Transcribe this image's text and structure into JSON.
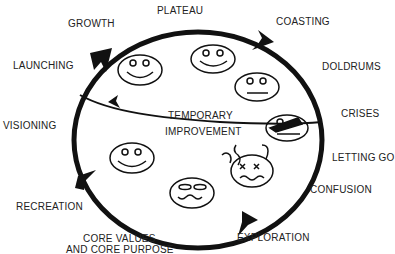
{
  "diagram": {
    "title": "",
    "colors": {
      "line": "#111111",
      "text": "#222222",
      "background": "#ffffff"
    },
    "stages": [
      {
        "id": "plateau",
        "label": "PLATEAU"
      },
      {
        "id": "coasting",
        "label": "COASTING"
      },
      {
        "id": "doldrums",
        "label": "DOLDRUMS"
      },
      {
        "id": "crises",
        "label": "CRISES"
      },
      {
        "id": "letting-go",
        "label": "LETTING GO"
      },
      {
        "id": "confusion",
        "label": "CONFUSION"
      },
      {
        "id": "exploration",
        "label": "EXPLORATION"
      },
      {
        "id": "core-values",
        "label_line1": "CORE VALUES",
        "label_line2": "AND CORE PURPOSE"
      },
      {
        "id": "recreation",
        "label": "RECREATION"
      },
      {
        "id": "visioning",
        "label": "VISIONING"
      },
      {
        "id": "launching",
        "label": "LAUNCHING"
      },
      {
        "id": "growth",
        "label": "GROWTH"
      }
    ],
    "shortcut": {
      "line1": "TEMPORARY",
      "line2": "IMPROVEMENT"
    },
    "faces": [
      {
        "id": "face-growth",
        "expression": "smile"
      },
      {
        "id": "face-plateau",
        "expression": "smile"
      },
      {
        "id": "face-doldrums",
        "expression": "neutral"
      },
      {
        "id": "face-crises",
        "expression": "distressed"
      },
      {
        "id": "face-letting-go",
        "expression": "dizzy"
      },
      {
        "id": "face-exploration",
        "expression": "wavy"
      },
      {
        "id": "face-recreation",
        "expression": "smile"
      }
    ],
    "flow_direction": "clockwise"
  }
}
